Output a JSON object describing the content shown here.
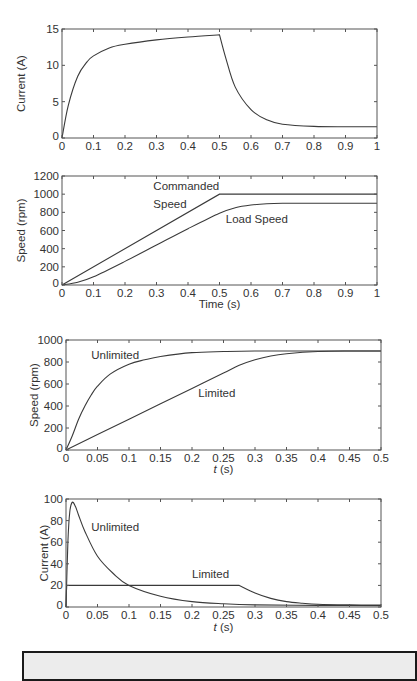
{
  "colors": {
    "line": "#3a3a3a",
    "axis": "#555555",
    "text": "#333333",
    "background": "#ffffff",
    "box_fill": "#ececec",
    "box_border": "#1a1a1a"
  },
  "chart_data": [
    {
      "type": "line",
      "title": "",
      "xlabel": "",
      "ylabel": "Current (A)",
      "xlim": [
        0,
        1
      ],
      "ylim": [
        0,
        15
      ],
      "grid": false,
      "legend": "none",
      "xticks": [
        "0",
        "0.1",
        "0.2",
        "0.3",
        "0.4",
        "0.5",
        "0.6",
        "0.7",
        "0.8",
        "0.9",
        "1"
      ],
      "yticks": [
        "0",
        "5",
        "10",
        "15"
      ],
      "series": [
        {
          "name": "Current",
          "x": [
            0,
            0.02,
            0.05,
            0.08,
            0.1,
            0.15,
            0.2,
            0.3,
            0.4,
            0.5,
            0.52,
            0.55,
            0.6,
            0.65,
            0.7,
            0.8,
            0.9,
            1.0
          ],
          "values": [
            0,
            4.5,
            8.5,
            10.5,
            11.3,
            12.4,
            12.9,
            13.5,
            13.9,
            14.2,
            11,
            7,
            3.9,
            2.5,
            1.9,
            1.6,
            1.55,
            1.55
          ]
        }
      ],
      "annotations": []
    },
    {
      "type": "line",
      "title": "",
      "xlabel": "Time (s)",
      "ylabel": "Speed (rpm)",
      "xlim": [
        0,
        1
      ],
      "ylim": [
        0,
        1200
      ],
      "grid": false,
      "legend": "none",
      "xticks": [
        "0",
        "0.1",
        "0.2",
        "0.3",
        "0.4",
        "0.5",
        "0.6",
        "0.7",
        "0.8",
        "0.9",
        "1"
      ],
      "yticks": [
        "0",
        "200",
        "400",
        "600",
        "800",
        "1000",
        "1200"
      ],
      "series": [
        {
          "name": "Commanded Speed",
          "x": [
            0,
            0.5,
            1.0
          ],
          "values": [
            0,
            1000,
            1000
          ]
        },
        {
          "name": "Load Speed",
          "x": [
            0,
            0.05,
            0.1,
            0.2,
            0.3,
            0.4,
            0.5,
            0.55,
            0.6,
            0.65,
            0.7,
            0.8,
            1.0
          ],
          "values": [
            0,
            30,
            90,
            260,
            440,
            620,
            790,
            850,
            880,
            895,
            900,
            900,
            900
          ]
        }
      ],
      "annotations": [
        {
          "text": "Commanded",
          "x": 0.29,
          "y": 1050
        },
        {
          "text": "Speed",
          "x": 0.29,
          "y": 850
        },
        {
          "text": "Load Speed",
          "x": 0.52,
          "y": 680
        }
      ]
    },
    {
      "type": "line",
      "title": "",
      "xlabel": "t (s)",
      "ylabel": "Speed (rpm)",
      "xlim": [
        0,
        0.5
      ],
      "ylim": [
        0,
        1000
      ],
      "grid": false,
      "legend": "none",
      "xticks": [
        "0",
        "0.05",
        "0.1",
        "0.15",
        "0.2",
        "0.25",
        "0.3",
        "0.35",
        "0.4",
        "0.45",
        "0.5"
      ],
      "yticks": [
        "0",
        "200",
        "400",
        "600",
        "800",
        "1000"
      ],
      "series": [
        {
          "name": "Unlimited",
          "x": [
            0,
            0.01,
            0.02,
            0.03,
            0.04,
            0.05,
            0.07,
            0.1,
            0.125,
            0.15,
            0.2,
            0.25,
            0.3,
            0.4,
            0.5
          ],
          "values": [
            0,
            130,
            280,
            400,
            500,
            580,
            690,
            780,
            820,
            850,
            885,
            895,
            900,
            900,
            900
          ]
        },
        {
          "name": "Limited",
          "x": [
            0,
            0.05,
            0.1,
            0.15,
            0.2,
            0.25,
            0.275,
            0.3,
            0.325,
            0.35,
            0.4,
            0.45,
            0.5
          ],
          "values": [
            0,
            140,
            280,
            420,
            560,
            700,
            770,
            820,
            855,
            875,
            895,
            900,
            900
          ]
        }
      ],
      "annotations": [
        {
          "text": "Unlimited",
          "x": 0.04,
          "y": 830
        },
        {
          "text": "Limited",
          "x": 0.21,
          "y": 480
        }
      ]
    },
    {
      "type": "line",
      "title": "",
      "xlabel": "t (s)",
      "ylabel": "Current  (A)",
      "xlim": [
        0,
        0.5
      ],
      "ylim": [
        0,
        100
      ],
      "grid": false,
      "legend": "none",
      "xticks": [
        "0",
        "0.05",
        "0.1",
        "0.15",
        "0.2",
        "0.25",
        "0.3",
        "0.35",
        "0.4",
        "0.45",
        "0.5"
      ],
      "yticks": [
        "0",
        "20",
        "40",
        "60",
        "80",
        "100"
      ],
      "series": [
        {
          "name": "Unlimited",
          "x": [
            0,
            0.003,
            0.006,
            0.01,
            0.015,
            0.02,
            0.03,
            0.05,
            0.075,
            0.1,
            0.15,
            0.2,
            0.25,
            0.3,
            0.4,
            0.5
          ],
          "values": [
            0,
            60,
            88,
            97,
            93,
            85,
            70,
            47,
            31,
            20,
            10,
            5,
            3,
            2,
            1.5,
            1.3
          ]
        },
        {
          "name": "Limited",
          "x": [
            0,
            0.001,
            0.275,
            0.3,
            0.325,
            0.35,
            0.375,
            0.4,
            0.45,
            0.5
          ],
          "values": [
            0,
            20,
            20,
            13,
            8,
            5,
            3.5,
            2.5,
            2,
            1.8
          ]
        }
      ],
      "annotations": [
        {
          "text": "Unlimited",
          "x": 0.04,
          "y": 70
        },
        {
          "text": "Limited",
          "x": 0.2,
          "y": 27
        }
      ]
    }
  ]
}
